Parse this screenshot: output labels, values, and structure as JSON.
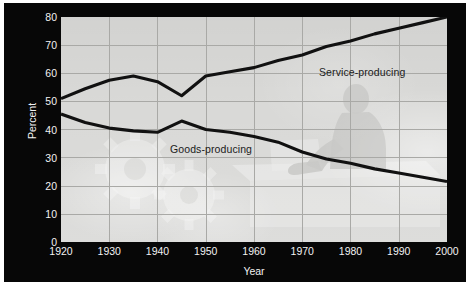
{
  "figure": {
    "background_color": "#ffffff",
    "panel_color": "#070707",
    "plot_background_color": "#d9d9d7",
    "grid_color": "#a9a9a6",
    "line_color": "#111111",
    "axis_text_color": "#f2f2f2",
    "series_label_color": "#1b1b1b"
  },
  "axes": {
    "y_title": "Percent",
    "x_title": "Year",
    "y_ticks": [
      "0",
      "10",
      "20",
      "30",
      "40",
      "50",
      "60",
      "70",
      "80"
    ],
    "x_ticks": [
      "1920",
      "1930",
      "1940",
      "1950",
      "1960",
      "1970",
      "1980",
      "1990",
      "2000"
    ]
  },
  "labels": {
    "service": "Service-producing",
    "goods": "Goods-producing"
  },
  "watermark": {
    "gears_icon": "gears-watermark",
    "office_worker_icon": "office-worker-watermark"
  },
  "chart_data": {
    "type": "line",
    "title": "",
    "subtitle": "",
    "xlabel": "Year",
    "ylabel": "Percent",
    "xlim": [
      1920,
      2000
    ],
    "ylim": [
      0,
      80
    ],
    "ytick_interval": 10,
    "xtick_interval": 10,
    "grid": true,
    "legend": "inline-series-labels",
    "annotations": [
      {
        "text": "Service-producing",
        "x": 1972,
        "y": 64
      },
      {
        "text": "Goods-producing",
        "x": 1943,
        "y": 34
      }
    ],
    "series": [
      {
        "name": "Service-producing",
        "label": "Service-producing",
        "color": "#111111",
        "x": [
          1920,
          1925,
          1930,
          1935,
          1940,
          1945,
          1950,
          1955,
          1960,
          1965,
          1970,
          1975,
          1980,
          1985,
          1990,
          1995,
          2000
        ],
        "values": [
          51.0,
          54.5,
          57.5,
          59.0,
          57.0,
          52.0,
          59.0,
          60.5,
          62.0,
          64.5,
          66.5,
          69.5,
          71.5,
          74.0,
          76.0,
          78.0,
          80.0
        ]
      },
      {
        "name": "Goods-producing",
        "label": "Goods-producing",
        "color": "#111111",
        "x": [
          1920,
          1925,
          1930,
          1935,
          1940,
          1945,
          1950,
          1955,
          1960,
          1965,
          1970,
          1975,
          1980,
          1985,
          1990,
          1995,
          2000
        ],
        "values": [
          45.5,
          42.5,
          40.5,
          39.5,
          39.0,
          43.0,
          40.0,
          39.0,
          37.5,
          35.5,
          32.0,
          29.5,
          28.0,
          26.0,
          24.5,
          23.0,
          21.5
        ]
      }
    ]
  }
}
